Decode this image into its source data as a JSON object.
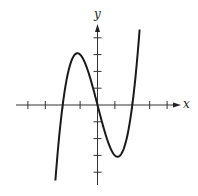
{
  "chart_data": {
    "type": "line",
    "title": "",
    "xlabel": "x",
    "ylabel": "y",
    "function": "f(x) = x^3 - 4x",
    "x_ticks": [
      -4,
      -3,
      -2,
      -1,
      1,
      2,
      3,
      4
    ],
    "y_ticks": [
      -4,
      -3,
      -2,
      -1,
      1,
      2,
      3,
      4
    ],
    "tick_labels_shown": false,
    "grid": false,
    "xlim": [
      -4.5,
      4.6
    ],
    "ylim": [
      -4.7,
      4.7
    ],
    "key_points": {
      "local_max": [
        -1.15,
        3.08
      ],
      "local_min": [
        1.15,
        -3.08
      ],
      "x_intercepts": [
        -2,
        0,
        2
      ]
    },
    "series": [
      {
        "name": "f(x)",
        "x": [
          -2.35,
          -2.2,
          -2.0,
          -1.8,
          -1.6,
          -1.4,
          -1.15,
          -1.0,
          -0.8,
          -0.6,
          -0.4,
          -0.2,
          0.0,
          0.2,
          0.4,
          0.6,
          0.8,
          1.0,
          1.15,
          1.4,
          1.6,
          1.8,
          2.0,
          2.2,
          2.4
        ],
        "y": [
          -3.58,
          -1.85,
          0.0,
          1.37,
          2.3,
          2.86,
          3.08,
          3.0,
          2.69,
          2.18,
          1.54,
          0.79,
          0.0,
          -0.79,
          -1.54,
          -2.18,
          -2.69,
          -3.0,
          -3.08,
          -2.86,
          -2.3,
          -1.37,
          0.0,
          1.85,
          4.22
        ]
      }
    ],
    "color": "#1a1a1a"
  },
  "labels": {
    "x_axis": "x",
    "y_axis": "y"
  }
}
